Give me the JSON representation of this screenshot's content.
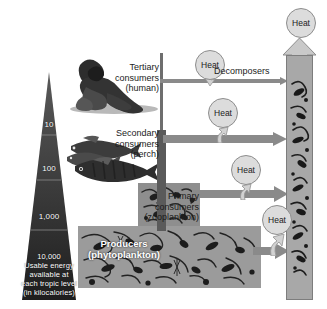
{
  "diagram": {
    "pyramid": {
      "levels": [
        {
          "id": "tertiary",
          "value": "10"
        },
        {
          "id": "secondary",
          "value": "100"
        },
        {
          "id": "primary",
          "value": "1,000"
        },
        {
          "id": "producers",
          "value": "10,000"
        }
      ],
      "caption_lines": [
        "10,000",
        "Usable energy",
        "available at",
        "each tropic level",
        "(in kilocalories)"
      ],
      "caption_full": "10,000 Usable energy available at each tropic level (in kilocalories)"
    },
    "trophic_labels": {
      "tertiary": {
        "line1": "Tertiary",
        "line2": "consumers",
        "line3": "(human)"
      },
      "secondary": {
        "line1": "Secondary",
        "line2": "consumers",
        "line3": "(perch)"
      },
      "primary": {
        "line1": "Primary",
        "line2": "consumers",
        "line3": "(zooplankton)"
      },
      "producers": {
        "line1": "Producers",
        "line2": "(phytoplankton)"
      }
    },
    "decomposers_label": "Decomposers",
    "heat_labels": {
      "top": "Heat",
      "decomposers": "Heat",
      "tertiary_flow": "Heat",
      "secondary_flow": "Heat",
      "producer_flow": "Heat"
    },
    "organisms": {
      "human": "human-figure-image",
      "perch": "perch-fish-image",
      "zooplankton": "zooplankton-image",
      "phytoplankton": "phytoplankton-image"
    },
    "colors": {
      "background": "#ffffff",
      "pyramid_fill": "#3a3a3a",
      "pyramid_text": "#ffffff",
      "arrow_gray": "#8e8e8e",
      "stem_gray": "#5a5a5a",
      "heat_fill": "#dcdcdc",
      "heat_stroke": "#8d8d8d",
      "column_fill": "#a8a8a8",
      "label_text": "#1b1b1b"
    }
  }
}
